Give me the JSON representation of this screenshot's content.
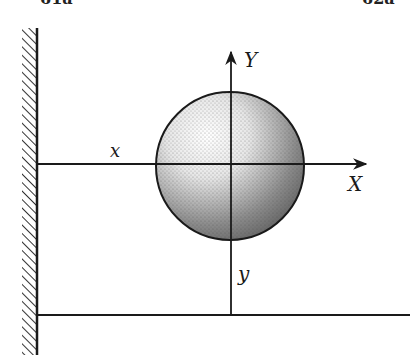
{
  "header_fragments": {
    "left": "61a",
    "right": "62a"
  },
  "diagram": {
    "type": "mechanics-figure",
    "labels": {
      "x_axis": "X",
      "y_axis": "Y",
      "x_distance": "x",
      "y_distance": "y"
    },
    "elements": {
      "wall": {
        "x": 37,
        "y_top": 28,
        "y_bottom": 355,
        "hatch_side": "left"
      },
      "floor_line": {
        "y": 315,
        "x_start": 37,
        "x_end": 410
      },
      "x_axis": {
        "y": 164,
        "x_start": 37,
        "x_end": 368,
        "arrow": true
      },
      "y_axis": {
        "x": 231,
        "y_start": 315,
        "y_end": 50,
        "arrow": true
      },
      "sphere": {
        "cx": 230,
        "cy": 166,
        "r": 74,
        "fill": "stippled"
      }
    },
    "colors": {
      "ink": "#1a1a1a",
      "background": "#ffffff"
    }
  }
}
